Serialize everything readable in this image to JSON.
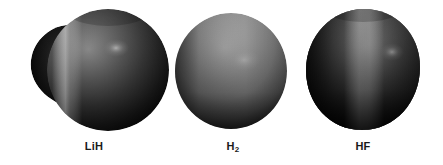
{
  "figure": {
    "background_color": "#ffffff",
    "label_color": "#1a1a1a"
  },
  "molecules": [
    {
      "id": "lih",
      "label_text": "LiH",
      "formula_base": "LiH",
      "formula_sub": "",
      "shape": "large sphere with smaller lobe protruding on the left",
      "surface_color_dark": "#0a0a0a",
      "surface_color_mid": "#4a4a4a",
      "surface_color_light": "#a8a8a8",
      "highlight_band": "vertical light band left of center",
      "specular_spot": "small light spot upper right of center"
    },
    {
      "id": "h2",
      "label_text": "H2",
      "formula_base": "H",
      "formula_sub": "2",
      "shape": "wide ellipsoid, nearly uniform mid-gray",
      "surface_color_dark": "#2b2b2b",
      "surface_color_mid": "#8c8c8c",
      "surface_color_light": "#bdbdbd",
      "highlight_band": "broad soft highlight across upper center",
      "specular_spot": "faint light spot right of center"
    },
    {
      "id": "hf",
      "label_text": "HF",
      "formula_base": "HF",
      "formula_sub": "",
      "shape": "egg-shaped ovoid, dark with bright vertical band",
      "surface_color_dark": "#0d0d0d",
      "surface_color_mid": "#4f4f4f",
      "surface_color_light": "#b0b0b0",
      "highlight_band": "bright vertical band through center-right",
      "specular_spot": "small light spot right of center"
    }
  ]
}
